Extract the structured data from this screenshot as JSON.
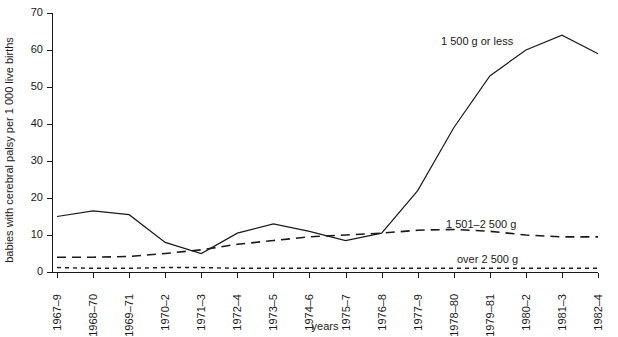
{
  "chart_data": {
    "type": "line",
    "title": "",
    "xlabel": "years",
    "ylabel": "babies with cerebral palsy per 1 000 live births",
    "ylim": [
      0,
      70
    ],
    "yticks": [
      0,
      10,
      20,
      30,
      40,
      50,
      60,
      70
    ],
    "grid": false,
    "legend_position": "inline-annotation",
    "categories": [
      "1967–9",
      "1968–70",
      "1969–71",
      "1970–2",
      "1971–3",
      "1972–4",
      "1973–5",
      "1974–6",
      "1975–7",
      "1976–8",
      "1977–9",
      "1978–80",
      "1979–81",
      "1980–2",
      "1981–3",
      "1982–4"
    ],
    "series": [
      {
        "name": "1 500 g or less",
        "style": "solid",
        "values": [
          15.0,
          16.5,
          15.5,
          8.0,
          5.0,
          10.5,
          13.0,
          11.0,
          8.5,
          10.5,
          22.0,
          39.0,
          53.0,
          60.0,
          64.0,
          59.0
        ]
      },
      {
        "name": "1 501–2 500 g",
        "style": "dashed",
        "values": [
          4.0,
          4.0,
          4.2,
          5.0,
          6.0,
          7.5,
          8.5,
          9.5,
          10.0,
          10.5,
          11.3,
          11.5,
          11.0,
          10.0,
          9.5,
          9.5
        ]
      },
      {
        "name": "over 2 500 g",
        "style": "dotted",
        "values": [
          1.2,
          1.0,
          1.0,
          1.2,
          1.2,
          1.0,
          1.0,
          1.0,
          1.0,
          1.0,
          1.0,
          1.0,
          1.0,
          1.0,
          1.0,
          1.0
        ]
      }
    ],
    "annotations": [
      {
        "text": "1 500 g or less",
        "x": 441,
        "y": 45
      },
      {
        "text": "1 501–2 500 g",
        "x": 446,
        "y": 228
      },
      {
        "text": "over 2 500 g",
        "x": 457,
        "y": 263
      }
    ],
    "colors": {
      "axis": "#1a1a1a",
      "series": "#1a1a1a",
      "background": "#ffffff"
    }
  },
  "geometry": {
    "plot_left": 52,
    "plot_right": 598,
    "plot_top": 13,
    "plot_bottom": 272,
    "first_tick_x": 57,
    "tick_spacing": 36.07
  }
}
